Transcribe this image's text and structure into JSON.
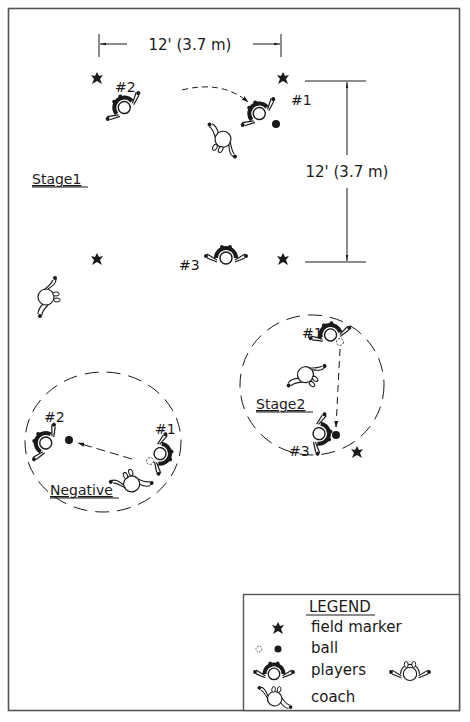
{
  "diagram": {
    "colors": {
      "ink": "#1a1a1a",
      "frame": "#555555",
      "paper": "#ffffff"
    },
    "dimensions": {
      "horizontal": {
        "label": "12' (3.7 m)"
      },
      "vertical": {
        "label": "12' (3.7 m)"
      }
    },
    "stages": {
      "stage1": {
        "title": "Stage1",
        "players": [
          {
            "label": "#2"
          },
          {
            "label": "#1"
          },
          {
            "label": "#3"
          }
        ]
      },
      "stage2": {
        "title": "Stage2",
        "players": [
          {
            "label": "#1"
          },
          {
            "label": "#3"
          }
        ]
      },
      "negative": {
        "title": "Negative",
        "players": [
          {
            "label": "#2"
          },
          {
            "label": "#1"
          }
        ]
      }
    },
    "legend": {
      "title": "LEGEND",
      "items": [
        {
          "icon": "field-marker-icon",
          "label": "field marker"
        },
        {
          "icon": "ball-icon",
          "label": "ball"
        },
        {
          "icon": "player-icon",
          "label": "players"
        },
        {
          "icon": "coach-icon",
          "label": "coach"
        }
      ]
    }
  }
}
